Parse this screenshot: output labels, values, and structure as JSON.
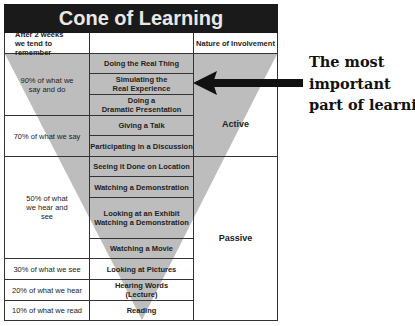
{
  "title": "Cone of Learning",
  "header": {
    "col_left": "After 2 weeks we tend to remember",
    "col_middle": "",
    "col_right": "Nature of Involvement"
  },
  "retention": [
    {
      "label": "90% of what we say and do"
    },
    {
      "label": "70% of what we say"
    },
    {
      "label": "50% of what we hear and see"
    },
    {
      "label": "30% of what we see"
    },
    {
      "label": "20% of what we hear"
    },
    {
      "label": "10% of what we read"
    }
  ],
  "activities": [
    {
      "line1": "Doing the Real Thing",
      "line2": ""
    },
    {
      "line1": "Simulating the",
      "line2": "Real Experience"
    },
    {
      "line1": "Doing a",
      "line2": "Dramatic Presentation"
    },
    {
      "line1": "Giving a Talk",
      "line2": ""
    },
    {
      "line1": "Participating in a Discussion",
      "line2": ""
    },
    {
      "line1": "Seeing it Done on Location",
      "line2": ""
    },
    {
      "line1": "Watching a Demonstration",
      "line2": ""
    },
    {
      "line1": "Looking at an Exhibit",
      "line2": "Watching a Demonstration"
    },
    {
      "line1": "Watching a Movie",
      "line2": ""
    },
    {
      "line1": "Looking at Pictures",
      "line2": ""
    },
    {
      "line1": "Hearing Words",
      "line2": "(Lecture)"
    },
    {
      "line1": "Reading",
      "line2": ""
    }
  ],
  "involvement": [
    {
      "label": "Active"
    },
    {
      "label": "Passive"
    }
  ],
  "callout": {
    "line1": "The most",
    "line2": "important",
    "line3": "part of learning"
  },
  "colors": {
    "title_bg": "#1a1a1a",
    "cone_fill": "#bdbdbd",
    "arrow": "#111111"
  }
}
